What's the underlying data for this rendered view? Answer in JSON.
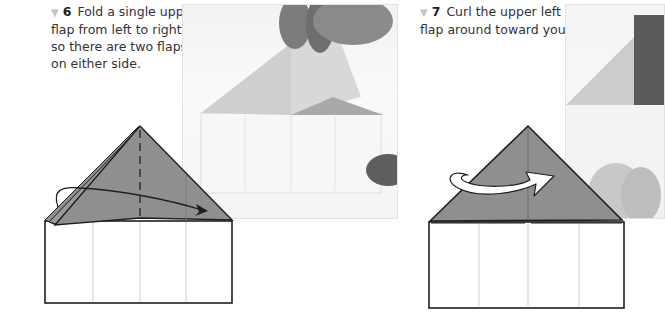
{
  "steps": [
    {
      "number": "6",
      "bullet_icon": "down-triangle-icon",
      "text": "Fold a single upper flap from left to right, so there are two flaps on either side."
    },
    {
      "number": "7",
      "bullet_icon": "down-triangle-icon",
      "text": "Curl the upper left flap around toward you."
    }
  ],
  "colors": {
    "paper_gray": "#8f8f8f",
    "outline": "#1e1e1e",
    "crease": "#cfcfcf",
    "bullet": "#c4c4c4"
  }
}
